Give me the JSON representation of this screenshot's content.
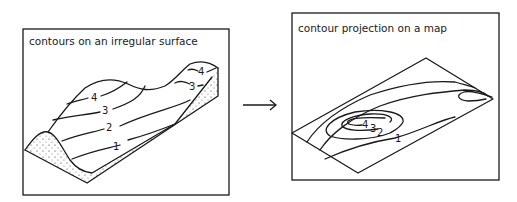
{
  "left_panel": {
    "title": "contours on an irregular surface",
    "contour_labels": [
      "1",
      "2",
      "3",
      "4",
      "3",
      "4"
    ]
  },
  "right_panel": {
    "title": "contour projection on a map",
    "contour_labels": [
      "4",
      "3",
      "2",
      "1"
    ]
  },
  "arrow": {
    "direction": "right"
  },
  "colors": {
    "ink": "#1a1a1a",
    "background": "#ffffff"
  }
}
